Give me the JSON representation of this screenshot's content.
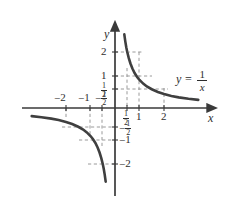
{
  "figure": {
    "title": "",
    "equation_label": {
      "lhs": "y",
      "equals": "=",
      "numerator": "1",
      "denominator": "x"
    },
    "axis_names": {
      "x": "x",
      "y": "y"
    },
    "colors": {
      "curve": "#3f3f3f",
      "axis": "#3a3a3a",
      "grid": "#8c8c8c",
      "text": "#2e2e2e",
      "background": "#ffffff"
    }
  },
  "chart_data": {
    "type": "line",
    "title": "",
    "xlabel": "x",
    "ylabel": "y",
    "equation": "y = 1/x",
    "xlim": [
      -3.2,
      3.6
    ],
    "ylim": [
      -3.2,
      3.2
    ],
    "grid": true,
    "grid_style": "dashed",
    "legend": "none",
    "xticks": [
      -2,
      -1,
      -0.5,
      0.5,
      1,
      2
    ],
    "xtick_labels": [
      "-2",
      "-1",
      "-1/2",
      "1/2",
      "1",
      "2"
    ],
    "yticks": [
      -2,
      -1,
      -0.5,
      0.5,
      1,
      2
    ],
    "ytick_labels": [
      "-2",
      "-1",
      "-1/2",
      "1/2",
      "1",
      "2"
    ],
    "series": [
      {
        "name": "y = 1/x (x > 0)",
        "x": [
          0.38,
          0.42,
          0.46,
          0.5,
          0.56,
          0.63,
          0.71,
          0.8,
          0.91,
          1.0,
          1.15,
          1.3,
          1.5,
          1.75,
          2.0,
          2.3,
          2.6,
          3.0,
          3.4
        ],
        "y": [
          2.63,
          2.38,
          2.17,
          2.0,
          1.79,
          1.59,
          1.41,
          1.25,
          1.1,
          1.0,
          0.87,
          0.77,
          0.67,
          0.57,
          0.5,
          0.43,
          0.38,
          0.33,
          0.29
        ]
      },
      {
        "name": "y = 1/x (x < 0)",
        "x": [
          -3.4,
          -3.0,
          -2.6,
          -2.3,
          -2.0,
          -1.75,
          -1.5,
          -1.3,
          -1.15,
          -1.0,
          -0.91,
          -0.8,
          -0.71,
          -0.63,
          -0.56,
          -0.5,
          -0.46,
          -0.42,
          -0.38
        ],
        "y": [
          -0.29,
          -0.33,
          -0.38,
          -0.43,
          -0.5,
          -0.57,
          -0.67,
          -0.77,
          -0.87,
          -1.0,
          -1.1,
          -1.25,
          -1.41,
          -1.59,
          -1.79,
          -2.0,
          -2.17,
          -2.38,
          -2.63
        ]
      }
    ],
    "gridlines_x": [
      -2,
      -1,
      -0.5,
      0.5,
      1,
      2
    ],
    "gridlines_y": [
      -2,
      -1,
      -0.5,
      0.5,
      1,
      2
    ]
  },
  "labels": {
    "x_neg2": "2",
    "x_neg1": "1",
    "x_neg_half_num": "1",
    "x_neg_half_den": "2",
    "x_half_num": "1",
    "x_half_den": "2",
    "x_pos1": "1",
    "x_pos2": "2",
    "y_pos2": "2",
    "y_pos1": "1",
    "y_half_num": "1",
    "y_half_den": "2",
    "y_neg_half_num": "1",
    "y_neg_half_den": "2",
    "y_neg1": "1",
    "y_neg2": "2",
    "minus": "−"
  }
}
